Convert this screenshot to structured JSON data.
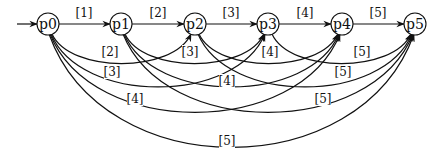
{
  "diagram": {
    "title": "",
    "nodes": [
      {
        "id": "p0",
        "label": "p0",
        "x": 48,
        "y": 24
      },
      {
        "id": "p1",
        "label": "p1",
        "x": 121,
        "y": 24
      },
      {
        "id": "p2",
        "label": "p2",
        "x": 195,
        "y": 24
      },
      {
        "id": "p3",
        "label": "p3",
        "x": 268,
        "y": 24
      },
      {
        "id": "p4",
        "label": "p4",
        "x": 342,
        "y": 24
      },
      {
        "id": "p5",
        "label": "p5",
        "x": 415,
        "y": 24
      }
    ],
    "initial_arrow": {
      "to": "p0"
    },
    "edges": [
      {
        "from": "p0",
        "to": "p1",
        "label": "[1]",
        "lx": 84,
        "ly": 17
      },
      {
        "from": "p1",
        "to": "p2",
        "label": "[2]",
        "lx": 158,
        "ly": 17
      },
      {
        "from": "p2",
        "to": "p3",
        "label": "[3]",
        "lx": 231,
        "ly": 17
      },
      {
        "from": "p3",
        "to": "p4",
        "label": "[4]",
        "lx": 305,
        "ly": 17
      },
      {
        "from": "p4",
        "to": "p5",
        "label": "[5]",
        "lx": 378,
        "ly": 17
      },
      {
        "from": "p0",
        "to": "p2",
        "label": "[2]",
        "lx": 110,
        "ly": 56
      },
      {
        "from": "p1",
        "to": "p3",
        "label": "[3]",
        "lx": 190,
        "ly": 56
      },
      {
        "from": "p2",
        "to": "p4",
        "label": "[4]",
        "lx": 270,
        "ly": 56
      },
      {
        "from": "p3",
        "to": "p5",
        "label": "[5]",
        "lx": 362,
        "ly": 56
      },
      {
        "from": "p0",
        "to": "p3",
        "label": "[3]",
        "lx": 112,
        "ly": 76
      },
      {
        "from": "p1",
        "to": "p4",
        "label": "[4]",
        "lx": 227,
        "ly": 85
      },
      {
        "from": "p2",
        "to": "p5",
        "label": "[5]",
        "lx": 343,
        "ly": 76
      },
      {
        "from": "p0",
        "to": "p4",
        "label": "[4]",
        "lx": 135,
        "ly": 103
      },
      {
        "from": "p1",
        "to": "p5",
        "label": "[5]",
        "lx": 323,
        "ly": 103
      },
      {
        "from": "p0",
        "to": "p5",
        "label": "[5]",
        "lx": 227,
        "ly": 145
      }
    ]
  }
}
